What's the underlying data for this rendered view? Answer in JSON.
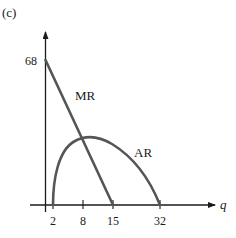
{
  "panel_label": "(c)",
  "axes": {
    "x_label": "q",
    "y_tick_label": "68",
    "x_ticks": [
      "2",
      "8",
      "15",
      "32"
    ]
  },
  "curves": {
    "mr_label": "MR",
    "ar_label": "AR"
  },
  "colors": {
    "axis": "#1a1a1a",
    "curve": "#555555",
    "text": "#1a1a1a"
  }
}
